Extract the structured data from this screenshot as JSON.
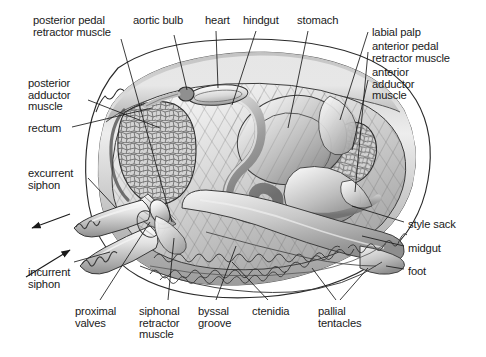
{
  "figure": {
    "background_color": "#ffffff",
    "line_color": "#1a1a1a",
    "text_color": "#1a1a1a",
    "shell_fill": "#f2f2f2",
    "mantle_fill": "#d6d6d6",
    "muscle_fill": "#c9c9c9",
    "gut_fill": "#9a9a9a",
    "foot_fill": "#cfcfcf"
  },
  "labels": [
    {
      "id": "posterior-pedal-retractor-muscle",
      "lines": [
        "posterior pedal",
        "retractor muscle"
      ],
      "x": 33,
      "y": 15,
      "align": "left"
    },
    {
      "id": "aortic-bulb",
      "lines": [
        "aortic bulb"
      ],
      "x": 133,
      "y": 15,
      "align": "left"
    },
    {
      "id": "heart",
      "lines": [
        "heart"
      ],
      "x": 205,
      "y": 15,
      "align": "left"
    },
    {
      "id": "hindgut",
      "lines": [
        "hindgut"
      ],
      "x": 243,
      "y": 15,
      "align": "left"
    },
    {
      "id": "stomach",
      "lines": [
        "stomach"
      ],
      "x": 297,
      "y": 15,
      "align": "left"
    },
    {
      "id": "labial-palp",
      "lines": [
        "labial palp"
      ],
      "x": 372,
      "y": 27,
      "align": "left"
    },
    {
      "id": "anterior-pedal-retractor-muscle",
      "lines": [
        "anterior pedal",
        "retractor muscle"
      ],
      "x": 372,
      "y": 41,
      "align": "left"
    },
    {
      "id": "anterior-adductor-muscle",
      "lines": [
        "anterior",
        "adductor",
        "muscle"
      ],
      "x": 372,
      "y": 67,
      "align": "left"
    },
    {
      "id": "posterior-adductor-muscle",
      "lines": [
        "posterior",
        "adductor",
        "muscle"
      ],
      "x": 28,
      "y": 78,
      "align": "left"
    },
    {
      "id": "rectum",
      "lines": [
        "rectum"
      ],
      "x": 28,
      "y": 123,
      "align": "left"
    },
    {
      "id": "excurrent-siphon",
      "lines": [
        "excurrent",
        "siphon"
      ],
      "x": 28,
      "y": 168,
      "align": "left"
    },
    {
      "id": "incurrent-siphon",
      "lines": [
        "incurrent",
        "siphon"
      ],
      "x": 28,
      "y": 267,
      "align": "left"
    },
    {
      "id": "proximal-valves",
      "lines": [
        "proximal",
        "valves"
      ],
      "x": 75,
      "y": 306,
      "align": "left"
    },
    {
      "id": "siphonal-retractor-muscle",
      "lines": [
        "siphonal",
        "retractor",
        "muscle"
      ],
      "x": 139,
      "y": 306,
      "align": "left"
    },
    {
      "id": "byssal-groove",
      "lines": [
        "byssal",
        "groove"
      ],
      "x": 198,
      "y": 306,
      "align": "left"
    },
    {
      "id": "ctenidia",
      "lines": [
        "ctenidia"
      ],
      "x": 252,
      "y": 306,
      "align": "left"
    },
    {
      "id": "pallial-tentacles",
      "lines": [
        "pallial",
        "tentacles"
      ],
      "x": 318,
      "y": 306,
      "align": "left"
    },
    {
      "id": "style-sack",
      "lines": [
        "style sack"
      ],
      "x": 408,
      "y": 219,
      "align": "left"
    },
    {
      "id": "midgut",
      "lines": [
        "midgut"
      ],
      "x": 408,
      "y": 243,
      "align": "left"
    },
    {
      "id": "foot",
      "lines": [
        "foot"
      ],
      "x": 408,
      "y": 266,
      "align": "left"
    }
  ],
  "flow_arrows": [
    {
      "id": "excurrent-flow-arrow",
      "direction": "out",
      "from": [
        68,
        214
      ],
      "to": [
        30,
        228
      ]
    },
    {
      "id": "incurrent-flow-arrow",
      "direction": "in",
      "from": [
        26,
        276
      ],
      "to": [
        72,
        248
      ]
    }
  ]
}
